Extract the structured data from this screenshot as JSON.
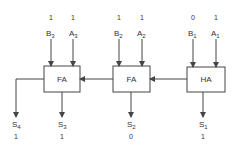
{
  "colors": {
    "stroke": "#444444",
    "text": "#333333",
    "background": "#ffffff"
  },
  "blocks": [
    {
      "id": "fa3",
      "label": "FA"
    },
    {
      "id": "fa2",
      "label": "FA"
    },
    {
      "id": "ha1",
      "label": "HA"
    }
  ],
  "inputs": [
    {
      "name": "B",
      "sub": "3",
      "value": "1"
    },
    {
      "name": "A",
      "sub": "3",
      "value": "1"
    },
    {
      "name": "B",
      "sub": "2",
      "value": "1"
    },
    {
      "name": "A",
      "sub": "2",
      "value": "1"
    },
    {
      "name": "B",
      "sub": "1",
      "value": "0"
    },
    {
      "name": "A",
      "sub": "1",
      "value": "1"
    }
  ],
  "outputs": [
    {
      "name": "S",
      "sub": "4",
      "value": "1"
    },
    {
      "name": "S",
      "sub": "3",
      "value": "1"
    },
    {
      "name": "S",
      "sub": "2",
      "value": "0"
    },
    {
      "name": "S",
      "sub": "1",
      "value": "1"
    }
  ]
}
